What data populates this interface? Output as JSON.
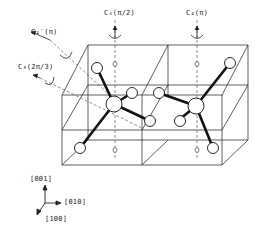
{
  "figure": {
    "type": "crystal-structure-diagram",
    "stroke_color": "#1a1a1a",
    "background": "#ffffff"
  },
  "symmetry_axes": [
    {
      "id": "c2prime",
      "label": "C'2(π)",
      "display": "C₂′(π)"
    },
    {
      "id": "c3",
      "label": "C3(2π/3)",
      "display": "C₃(2π/3)"
    },
    {
      "id": "c4",
      "label": "C4(π/2)",
      "display": "C₄(π/2)"
    },
    {
      "id": "c2",
      "label": "C2(π)",
      "display": "C₂(π)"
    }
  ],
  "axes_legend": {
    "z": "[001]",
    "y": "[010]",
    "x": "[100]"
  }
}
